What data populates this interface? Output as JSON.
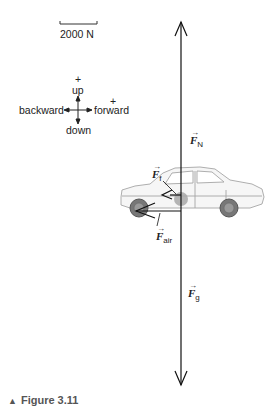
{
  "scale": {
    "label": "2000 N"
  },
  "axes": {
    "up_sign": "+",
    "up": "up",
    "forward_sign": "+",
    "forward": "forward",
    "backward": "backward",
    "down": "down"
  },
  "forces": {
    "normal": {
      "symbol": "F",
      "subscript": "N",
      "arrow": "→"
    },
    "friction": {
      "symbol": "F",
      "subscript": "f",
      "arrow": "→"
    },
    "air": {
      "symbol": "F",
      "subscript": "air",
      "arrow": "→"
    },
    "gravity": {
      "symbol": "F",
      "subscript": "g",
      "arrow": "→"
    }
  },
  "caption": {
    "marker": "▲",
    "text": "Figure 3.11"
  },
  "colors": {
    "line": "#111111",
    "car_outline": "#9a9a9a",
    "center_dot": "#a0a0a0",
    "caption": "#555555"
  }
}
